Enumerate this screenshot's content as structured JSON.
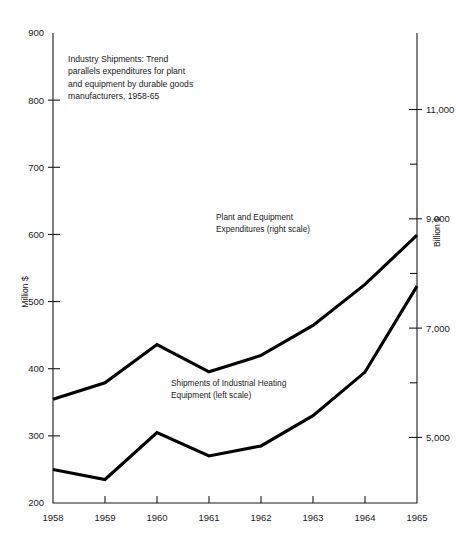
{
  "chart_data": {
    "type": "line",
    "title_lines": [
      "Industry Shipments:  Trend",
      "parallels expenditures for plant",
      "and equipment by durable goods",
      "manufacturers, 1958-65"
    ],
    "categories": [
      "1958",
      "1959",
      "1960",
      "1961",
      "1962",
      "1963",
      "1964",
      "1965"
    ],
    "x": [
      1958,
      1959,
      1960,
      1961,
      1962,
      1963,
      1964,
      1965
    ],
    "xlabel": "",
    "ylabel": "Million $",
    "y2label": "Billion $",
    "ylim": [
      200,
      900
    ],
    "y2lim": [
      3800,
      12400
    ],
    "yticks": [
      200,
      300,
      400,
      500,
      600,
      700,
      800,
      900
    ],
    "ytick_labels": [
      "200",
      "300",
      "400",
      "500",
      "600",
      "700",
      "800",
      "900"
    ],
    "y2ticks": [
      5000,
      6000,
      7000,
      8000,
      9000,
      10000,
      11000
    ],
    "y2tick_labels": [
      "5,000",
      "",
      "7,000",
      "",
      "9,000",
      "",
      "11,000"
    ],
    "grid": false,
    "legend_position": "inline-annotations",
    "series": [
      {
        "name": "Shipments of Industrial Heating Equipment (left scale)",
        "name_lines": [
          "Shipments of Industrial Heating",
          "Equipment (left scale)"
        ],
        "axis": "left",
        "unit": "Million $",
        "values": [
          250,
          235,
          305,
          270,
          285,
          330,
          395,
          523
        ],
        "color": "#000000"
      },
      {
        "name": "Plant and Equipment Expenditures (right scale)",
        "name_lines": [
          "Plant and Equipment",
          "Expenditures (right scale)"
        ],
        "axis": "right",
        "unit": "Billion $",
        "values": [
          5700,
          6000,
          6700,
          6200,
          6500,
          7050,
          7800,
          8700
        ],
        "left_scale_equivalent": [
          578,
          600,
          670,
          622,
          652,
          705,
          778,
          868
        ],
        "color": "#000000"
      }
    ],
    "annotations": [
      {
        "id": "chart-note",
        "text": "Industry Shipments:  Trend parallels expenditures for plant and equipment by durable goods manufacturers, 1958-65",
        "x_px": 68,
        "y_px": 62
      },
      {
        "id": "upper-series-label",
        "text": "Plant and Equipment Expenditures (right scale)",
        "x_px": 216,
        "y_px": 220
      },
      {
        "id": "lower-series-label",
        "text": "Shipments of Industrial Heating Equipment (left scale)",
        "x_px": 171,
        "y_px": 386
      }
    ]
  },
  "axes": {
    "left": {
      "title": "Million $",
      "labels": [
        "900",
        "800",
        "700",
        "600",
        "500",
        "400",
        "300",
        "200"
      ]
    },
    "right": {
      "title": "Billion $",
      "labels": [
        "11,000",
        "9,000",
        "7,000",
        "5,000"
      ]
    },
    "bottom": {
      "labels": [
        "1958",
        "1959",
        "1960",
        "1961",
        "1962",
        "1963",
        "1964",
        "1965"
      ]
    }
  }
}
